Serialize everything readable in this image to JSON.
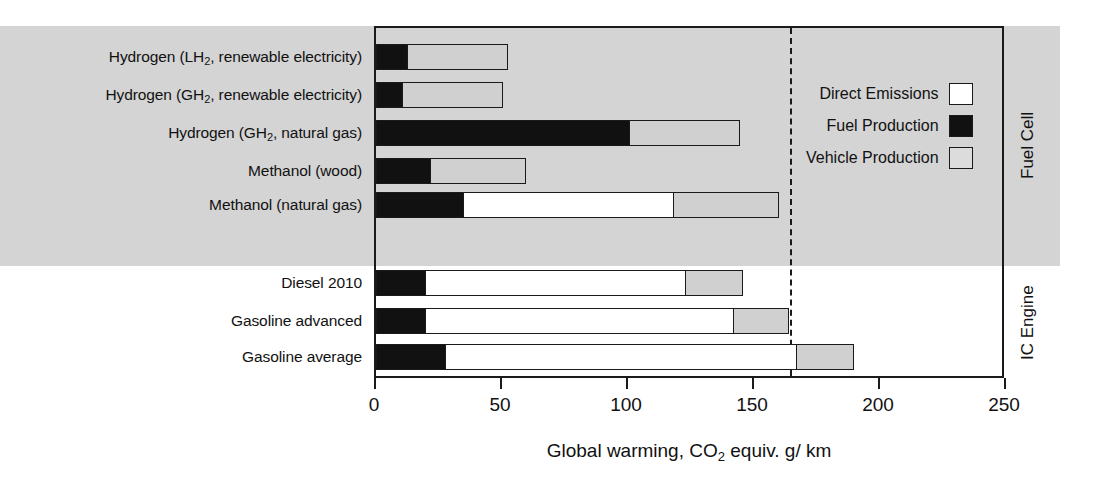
{
  "chart_data": {
    "type": "bar",
    "orientation": "horizontal",
    "stacked": true,
    "title": "",
    "xlabel": "Global warming, CO2 equiv. g/ km",
    "ylabel": "",
    "xlim": [
      0,
      250
    ],
    "xticks": [
      0,
      50,
      100,
      150,
      200,
      250
    ],
    "xtick_labels": [
      "0",
      "50",
      "100",
      "150",
      "200",
      "250"
    ],
    "grid": false,
    "legend_position": "upper right",
    "series": [
      {
        "name": "Direct Emissions",
        "color": "#ffffff",
        "values": [
          0,
          0,
          0,
          0,
          84,
          104,
          123,
          140
        ]
      },
      {
        "name": "Fuel Production",
        "color": "#111111",
        "values": [
          13,
          11,
          101,
          22,
          35,
          20,
          20,
          28
        ]
      },
      {
        "name": "Vehicle Production",
        "color": "#d0d0d0",
        "values": [
          40,
          40,
          44,
          38,
          42,
          23,
          22,
          23
        ]
      }
    ],
    "categories": [
      "Hydrogen (LH2, renewable electricity)",
      "Hydrogen (GH2, renewable electricity)",
      "Hydrogen (GH2, natural gas)",
      "Methanol (wood)",
      "Methanol (natural gas)",
      "Diesel 2010",
      "Gasoline advanced",
      "Gasoline average"
    ],
    "totals": [
      53,
      51,
      146,
      60,
      161,
      148,
      165,
      191
    ],
    "reference_line": {
      "value": 165,
      "style": "dashed"
    },
    "groups": [
      {
        "label": "Fuel Cell",
        "categories": [
          0,
          1,
          2,
          3,
          4
        ],
        "shaded": true
      },
      {
        "label": "IC Engine",
        "categories": [
          5,
          6,
          7
        ],
        "shaded": false
      }
    ]
  },
  "axis": {
    "title_prefix": "Global warming, CO",
    "title_sub": "2",
    "title_suffix": " equiv. g/ km",
    "ticks": [
      {
        "label": "0",
        "value": 0
      },
      {
        "label": "50",
        "value": 50
      },
      {
        "label": "100",
        "value": 100
      },
      {
        "label": "150",
        "value": 150
      },
      {
        "label": "200",
        "value": 200
      },
      {
        "label": "250",
        "value": 250
      }
    ]
  },
  "legend": {
    "items": [
      {
        "label": "Direct Emissions",
        "swatch": "direct"
      },
      {
        "label": "Fuel Production",
        "swatch": "fuel"
      },
      {
        "label": "Vehicle Production",
        "swatch": "vehicle"
      }
    ]
  },
  "categories": [
    {
      "prefix": "Hydrogen (LH",
      "sub": "2",
      "suffix": ", renewable electricity)",
      "top": 44,
      "segments": [
        {
          "cls": "fuel",
          "v": 13
        },
        {
          "cls": "vehicle",
          "v": 40
        }
      ]
    },
    {
      "prefix": "Hydrogen (GH",
      "sub": "2",
      "suffix": ", renewable electricity)",
      "top": 82,
      "segments": [
        {
          "cls": "fuel",
          "v": 11
        },
        {
          "cls": "vehicle",
          "v": 40
        }
      ]
    },
    {
      "prefix": "Hydrogen (GH",
      "sub": "2",
      "suffix": ", natural gas)",
      "top": 120,
      "segments": [
        {
          "cls": "fuel",
          "v": 101
        },
        {
          "cls": "vehicle",
          "v": 44
        }
      ]
    },
    {
      "prefix": "Methanol (wood)",
      "sub": "",
      "suffix": "",
      "top": 158,
      "segments": [
        {
          "cls": "fuel",
          "v": 22
        },
        {
          "cls": "vehicle",
          "v": 38
        }
      ]
    },
    {
      "prefix": "Methanol (natural gas)",
      "sub": "",
      "suffix": "",
      "top": 192,
      "segments": [
        {
          "cls": "fuel",
          "v": 35
        },
        {
          "cls": "direct",
          "v": 84
        },
        {
          "cls": "vehicle",
          "v": 42
        }
      ]
    },
    {
      "prefix": "Diesel 2010",
      "sub": "",
      "suffix": "",
      "top": 270,
      "segments": [
        {
          "cls": "fuel",
          "v": 20
        },
        {
          "cls": "direct",
          "v": 104
        },
        {
          "cls": "vehicle",
          "v": 23
        }
      ]
    },
    {
      "prefix": "Gasoline advanced",
      "sub": "",
      "suffix": "",
      "top": 308,
      "segments": [
        {
          "cls": "fuel",
          "v": 20
        },
        {
          "cls": "direct",
          "v": 123
        },
        {
          "cls": "vehicle",
          "v": 22
        }
      ]
    },
    {
      "prefix": "Gasoline average",
      "sub": "",
      "suffix": "",
      "top": 344,
      "segments": [
        {
          "cls": "fuel",
          "v": 28
        },
        {
          "cls": "direct",
          "v": 140
        },
        {
          "cls": "vehicle",
          "v": 23
        }
      ]
    }
  ],
  "groups": {
    "fuel_cell": "Fuel Cell",
    "ic_engine": "IC Engine"
  }
}
